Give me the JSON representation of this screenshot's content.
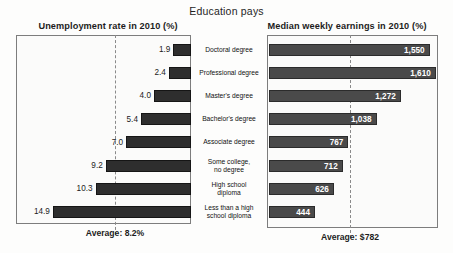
{
  "header": {
    "title": "Education pays"
  },
  "panels": {
    "left_title": "Unemployment rate in 2010 (%)",
    "right_title": "Median weekly earnings in 2010 (%)",
    "left_average_label": "Average: 8.2%",
    "right_average_label": "Average: $782"
  },
  "colors": {
    "left_bar": "#2e2e2e",
    "right_bar": "#4a4a4a",
    "frame": "#7d7d7d",
    "dashed_line": "#8a8a8a",
    "background": "#fdfdfc"
  },
  "chart_data": {
    "type": "bar",
    "title": "Education pays",
    "orientation": "horizontal",
    "grid": false,
    "legend": false,
    "categories": [
      "Doctoral degree",
      "Professional degree",
      "Master's degree",
      "Bachelor's degree",
      "Associate degree",
      "Some college,\nno degree",
      "High school\ndiploma",
      "Less than a high\nschool diploma"
    ],
    "series": [
      {
        "name": "Unemployment rate in 2010 (%)",
        "panel": "left",
        "direction": "right-to-left",
        "unit": "%",
        "values": [
          1.9,
          2.4,
          4.0,
          5.4,
          7.0,
          9.2,
          10.3,
          14.9
        ],
        "labels": [
          "1.9",
          "2.4",
          "4.0",
          "5.4",
          "7.0",
          "9.2",
          "10.3",
          "14.9"
        ],
        "average": 8.2,
        "average_label": "Average: 8.2%",
        "xlim": [
          0,
          16
        ]
      },
      {
        "name": "Median weekly earnings in 2010 (%)",
        "panel": "right",
        "direction": "left-to-right",
        "unit": "$",
        "values": [
          1550,
          1610,
          1272,
          1038,
          767,
          712,
          626,
          444
        ],
        "labels": [
          "1,550",
          "1,610",
          "1,272",
          "1,038",
          "767",
          "712",
          "626",
          "444"
        ],
        "average": 782,
        "average_label": "Average: $782",
        "xlim": [
          0,
          1700
        ]
      }
    ]
  }
}
